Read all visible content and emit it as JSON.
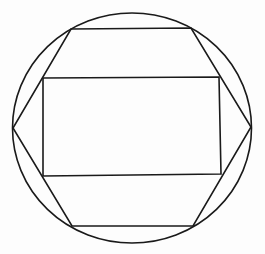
{
  "diagram": {
    "stroke_color": "#1a1a1a",
    "background_color": "#fdfdfd",
    "stroke_width": 1.6,
    "circle": {
      "cx": 132,
      "cy": 128,
      "rx": 119.5,
      "ry": 115
    },
    "hexagon": {
      "points": [
        [
          71,
          29
        ],
        [
          191,
          28
        ],
        [
          251,
          127
        ],
        [
          193,
          226
        ],
        [
          72,
          226
        ],
        [
          13,
          128
        ]
      ]
    },
    "rectangle": {
      "points": [
        [
          43,
          78
        ],
        [
          219,
          77
        ],
        [
          221,
          174
        ],
        [
          43,
          176
        ]
      ]
    }
  }
}
